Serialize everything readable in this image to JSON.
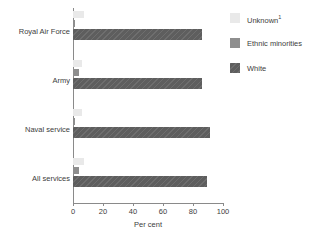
{
  "chart_data": {
    "type": "bar",
    "orientation": "horizontal",
    "title": "",
    "subtitle": "",
    "xlabel": "Per cent",
    "ylabel": "",
    "xlim": [
      0,
      100
    ],
    "xticks": [
      0,
      20,
      40,
      60,
      80,
      100
    ],
    "xticklabels": [
      "0",
      "20",
      "40",
      "60",
      "80",
      "100"
    ],
    "grid": false,
    "legend_position": "right",
    "categories": [
      "Royal Air Force",
      "Army",
      "Naval service",
      "All services"
    ],
    "series": [
      {
        "name": "Unknown",
        "name_superscript": "1",
        "color": "#e9e9e9",
        "values": [
          7,
          6,
          6,
          7
        ]
      },
      {
        "name": "Ethnic minorities",
        "name_superscript": "",
        "color": "#8e8e8e",
        "values": [
          1,
          4,
          1,
          4
        ]
      },
      {
        "name": "White",
        "name_superscript": "",
        "color": "#5e5e5e",
        "values": [
          86,
          86,
          91,
          89
        ]
      }
    ]
  },
  "axis": {
    "x_title": "Per cent"
  },
  "legend": {
    "items": [
      {
        "label": "Unknown",
        "superscript": "1"
      },
      {
        "label": "Ethnic minorities",
        "superscript": ""
      },
      {
        "label": "White",
        "superscript": ""
      }
    ]
  }
}
